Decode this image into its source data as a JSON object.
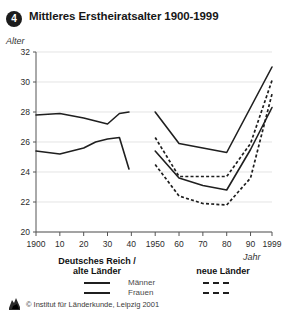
{
  "header": {
    "badge": "4",
    "title": "Mittleres Erstheiratsalter 1900-1999"
  },
  "axes": {
    "y_caption": "Alter",
    "x_caption": "Jahr"
  },
  "legend": {
    "left_title_line1": "Deutsches Reich /",
    "left_title_line2": "alte Länder",
    "right_title": "neue Länder",
    "series_label_men": "Männer",
    "series_label_women": "Frauen"
  },
  "footer": {
    "copyright": "© Institut für Länderkunde, Leipzig 2001"
  },
  "colors": {
    "line": "#1f1f1f",
    "grid": "#d8d8d8",
    "axis": "#555555",
    "badge_bg": "#1c1c1c",
    "text": "#171717"
  },
  "chart_data": {
    "type": "line",
    "title": "Mittleres Erstheiratsalter 1900-1999",
    "xlabel": "Jahr",
    "ylabel": "Alter",
    "xlim": [
      1900,
      1999
    ],
    "ylim": [
      20,
      32
    ],
    "ytick_labels": [
      "20",
      "22",
      "24",
      "26",
      "28",
      "30",
      "32"
    ],
    "yticks": [
      20,
      22,
      24,
      26,
      28,
      30,
      32
    ],
    "xtick_labels": [
      "1900",
      "10",
      "20",
      "30",
      "40",
      "1950",
      "60",
      "70",
      "80",
      "90",
      "1999"
    ],
    "xticks": [
      1900,
      1910,
      1920,
      1930,
      1940,
      1950,
      1960,
      1970,
      1980,
      1990,
      1999
    ],
    "grid": true,
    "legend_position": "below",
    "series": [
      {
        "name": "Deutsches Reich / alte Länder – Männer",
        "region": "Deutsches Reich / alte Länder",
        "gender": "Männer",
        "style": "solid",
        "x": [
          1900,
          1910,
          1920,
          1925,
          1930,
          1935,
          1939
        ],
        "values": [
          27.8,
          27.9,
          27.6,
          27.4,
          27.2,
          27.9,
          28.0
        ]
      },
      {
        "name": "Deutsches Reich / alte Länder – Frauen",
        "region": "Deutsches Reich / alte Länder",
        "gender": "Frauen",
        "style": "solid",
        "x": [
          1900,
          1910,
          1920,
          1925,
          1930,
          1935,
          1939
        ],
        "values": [
          25.4,
          25.2,
          25.6,
          26.0,
          26.2,
          26.3,
          24.2
        ]
      },
      {
        "name": "alte Länder – Männer",
        "region": "alte Länder",
        "gender": "Männer",
        "style": "solid",
        "x": [
          1950,
          1960,
          1970,
          1980,
          1990,
          1999
        ],
        "values": [
          28.0,
          25.9,
          25.6,
          25.3,
          28.3,
          31.0
        ]
      },
      {
        "name": "alte Länder – Frauen",
        "region": "alte Länder",
        "gender": "Frauen",
        "style": "solid",
        "x": [
          1950,
          1960,
          1970,
          1980,
          1990,
          1999
        ],
        "values": [
          25.4,
          23.6,
          23.1,
          22.8,
          25.5,
          28.3
        ]
      },
      {
        "name": "neue Länder – Männer",
        "region": "neue Länder",
        "gender": "Männer",
        "style": "dashed",
        "x": [
          1950,
          1960,
          1970,
          1980,
          1990,
          1999
        ],
        "values": [
          26.3,
          23.7,
          23.7,
          23.7,
          25.9,
          30.1
        ]
      },
      {
        "name": "neue Länder – Frauen",
        "region": "neue Länder",
        "gender": "Frauen",
        "style": "dashed",
        "x": [
          1950,
          1960,
          1970,
          1980,
          1990,
          1999
        ],
        "values": [
          24.5,
          22.4,
          21.9,
          21.8,
          23.6,
          29.2
        ]
      }
    ]
  }
}
